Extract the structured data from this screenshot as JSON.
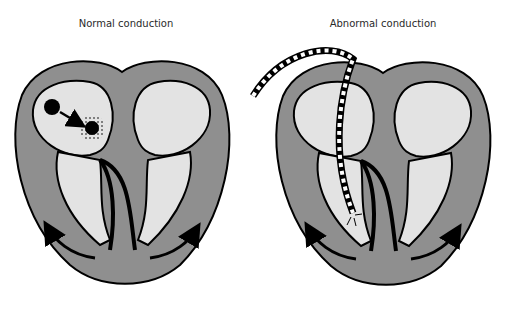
{
  "panels": [
    {
      "title": "Normal conduction"
    },
    {
      "title": "Abnormal conduction"
    }
  ],
  "colors": {
    "myocardium": "#8f8f8f",
    "chamber": "#e3e3e3",
    "outline": "#000000",
    "background": "#ffffff"
  },
  "icons": {
    "sa_node": "black-circle",
    "av_node": "black-circle-with-stipple",
    "pacing_lead": "dashed-black-white-lead",
    "conduction_arrow": "curved-arrow"
  }
}
